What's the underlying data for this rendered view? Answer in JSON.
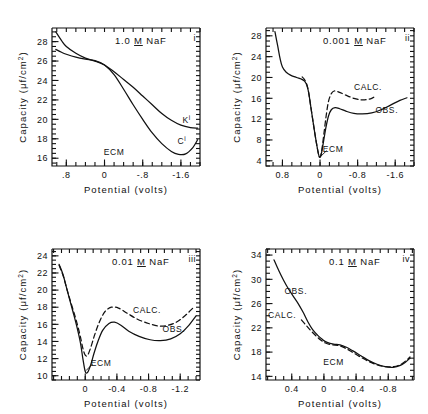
{
  "figure": {
    "axis_x_title": "Potential  (volts)",
    "axis_y_title": "Capacity (μf/cm²)"
  },
  "chart_data": [
    {
      "type": "line",
      "panel": "i",
      "roman": "i",
      "title": "1.0 M NaF",
      "concentration_prefix": "1.0",
      "concentration_molar": "M",
      "concentration_salt": "NaF",
      "xlabel": "Potential  (volts)",
      "ylabel": "Capacity (μf/cm²)",
      "xlim": [
        1.1,
        -2.0
      ],
      "ylim": [
        15.2,
        29.4
      ],
      "xticks": [
        0.8,
        0.0,
        -0.8,
        -1.6
      ],
      "xtick_labels": [
        ".8",
        "0",
        "-.8",
        "-1.6"
      ],
      "yticks": [
        28,
        26,
        24,
        22,
        20,
        18,
        16
      ],
      "ytick_labels": [
        "28",
        "26",
        "24",
        "22",
        "20",
        "18",
        "16"
      ],
      "minor_x_step": 0.2,
      "minor_y_step": 0.5,
      "grid": false,
      "annotations": [
        {
          "text": "ECM",
          "x": -0.2,
          "y": 16.3
        },
        {
          "text": "K",
          "superscript": "i",
          "x": -1.72,
          "y": 19.6
        },
        {
          "text": "C",
          "superscript": "i",
          "x": -1.62,
          "y": 17.5
        }
      ],
      "series": [
        {
          "name": "K-curve",
          "style": "solid",
          "points": [
            [
              1.02,
              29.0
            ],
            [
              0.9,
              28.1
            ],
            [
              0.8,
              27.5
            ],
            [
              0.6,
              26.8
            ],
            [
              0.4,
              26.3
            ],
            [
              0.2,
              26.0
            ],
            [
              0.0,
              25.6
            ],
            [
              -0.2,
              24.9
            ],
            [
              -0.4,
              24.1
            ],
            [
              -0.6,
              23.3
            ],
            [
              -0.8,
              22.4
            ],
            [
              -1.0,
              21.5
            ],
            [
              -1.2,
              20.6
            ],
            [
              -1.4,
              19.9
            ],
            [
              -1.6,
              19.4
            ],
            [
              -1.8,
              19.15
            ],
            [
              -1.95,
              19.1
            ]
          ]
        },
        {
          "name": "C-curve",
          "style": "solid",
          "points": [
            [
              1.02,
              27.2
            ],
            [
              0.9,
              26.9
            ],
            [
              0.8,
              26.7
            ],
            [
              0.6,
              26.4
            ],
            [
              0.4,
              26.2
            ],
            [
              0.2,
              26.05
            ],
            [
              0.0,
              25.6
            ],
            [
              -0.2,
              24.6
            ],
            [
              -0.4,
              23.1
            ],
            [
              -0.6,
              21.5
            ],
            [
              -0.8,
              20.0
            ],
            [
              -1.0,
              18.6
            ],
            [
              -1.2,
              17.5
            ],
            [
              -1.4,
              16.7
            ],
            [
              -1.55,
              16.4
            ],
            [
              -1.7,
              16.45
            ],
            [
              -1.85,
              17.1
            ],
            [
              -1.95,
              17.9
            ]
          ]
        }
      ]
    },
    {
      "type": "line",
      "panel": "ii",
      "roman": "ii",
      "title": "0.001 M NaF",
      "concentration_prefix": "0.001",
      "concentration_molar": "M",
      "concentration_salt": "NaF",
      "xlabel": "Potential  (volts)",
      "ylabel": "Capacity (μf/cm²)",
      "xlim": [
        1.15,
        -2.0
      ],
      "ylim": [
        3.0,
        29.5
      ],
      "xticks": [
        0.8,
        0.0,
        -0.8,
        -1.6
      ],
      "xtick_labels": [
        "0.8",
        "0",
        "-0.8",
        "-1.6"
      ],
      "yticks": [
        28,
        24,
        20,
        16,
        12,
        8,
        4
      ],
      "ytick_labels": [
        "28",
        "24",
        "20",
        "16",
        "12",
        "8",
        "4"
      ],
      "minor_x_step": 0.2,
      "minor_y_step": 1.0,
      "grid": false,
      "annotations": [
        {
          "text": "ECM",
          "x": -0.28,
          "y": 5.6
        },
        {
          "text": "CALC.",
          "x": -1.02,
          "y": 17.6
        },
        {
          "text": "OBS.",
          "x": -1.42,
          "y": 13.2
        }
      ],
      "series": [
        {
          "name": "OBS.",
          "style": "solid",
          "points": [
            [
              0.96,
              28.8
            ],
            [
              0.9,
              26.0
            ],
            [
              0.85,
              23.6
            ],
            [
              0.8,
              22.0
            ],
            [
              0.72,
              21.0
            ],
            [
              0.62,
              20.4
            ],
            [
              0.5,
              20.0
            ],
            [
              0.4,
              19.7
            ],
            [
              0.33,
              19.3
            ],
            [
              0.28,
              18.5
            ],
            [
              0.24,
              17.0
            ],
            [
              0.2,
              14.6
            ],
            [
              0.14,
              11.0
            ],
            [
              0.08,
              7.6
            ],
            [
              0.03,
              5.2
            ],
            [
              0.0,
              4.7
            ],
            [
              -0.03,
              5.4
            ],
            [
              -0.08,
              8.0
            ],
            [
              -0.13,
              10.6
            ],
            [
              -0.18,
              12.6
            ],
            [
              -0.24,
              13.8
            ],
            [
              -0.32,
              14.2
            ],
            [
              -0.42,
              14.0
            ],
            [
              -0.56,
              13.5
            ],
            [
              -0.72,
              13.1
            ],
            [
              -0.9,
              13.0
            ],
            [
              -1.1,
              13.2
            ],
            [
              -1.3,
              13.8
            ],
            [
              -1.5,
              14.7
            ],
            [
              -1.7,
              15.6
            ],
            [
              -1.85,
              16.1
            ]
          ]
        },
        {
          "name": "CALC.",
          "style": "dashed",
          "points": [
            [
              0.38,
              20.1
            ],
            [
              0.33,
              19.6
            ],
            [
              0.28,
              18.6
            ],
            [
              0.24,
              17.0
            ],
            [
              0.2,
              14.6
            ],
            [
              0.14,
              11.0
            ],
            [
              0.08,
              7.6
            ],
            [
              0.03,
              5.2
            ],
            [
              0.0,
              4.7
            ],
            [
              -0.03,
              5.6
            ],
            [
              -0.08,
              9.0
            ],
            [
              -0.13,
              12.6
            ],
            [
              -0.18,
              15.4
            ],
            [
              -0.24,
              16.9
            ],
            [
              -0.3,
              17.4
            ],
            [
              -0.4,
              17.2
            ],
            [
              -0.55,
              16.6
            ],
            [
              -0.72,
              16.0
            ],
            [
              -0.88,
              15.7
            ],
            [
              -1.0,
              15.75
            ],
            [
              -1.1,
              16.0
            ],
            [
              -1.18,
              16.4
            ]
          ]
        }
      ]
    },
    {
      "type": "line",
      "panel": "iii",
      "roman": "iii",
      "title": "0.01 M NaF",
      "concentration_prefix": "0.01",
      "concentration_molar": "M",
      "concentration_salt": "NaF",
      "xlabel": "Potential  (volts)",
      "ylabel": "Capacity (μf/cm²)",
      "xlim": [
        0.42,
        -1.45
      ],
      "ylim": [
        9.5,
        24.8
      ],
      "xticks": [
        0.0,
        -0.4,
        -0.8,
        -1.2
      ],
      "xtick_labels": [
        "0",
        "-0.4",
        "-0.8",
        "-1.2"
      ],
      "yticks": [
        24,
        22,
        20,
        18,
        16,
        14,
        12,
        10
      ],
      "ytick_labels": [
        "24",
        "22",
        "20",
        "18",
        "16",
        "14",
        "12",
        "10"
      ],
      "minor_x_step": 0.1,
      "minor_y_step": 0.5,
      "grid": false,
      "annotations": [
        {
          "text": "ECM",
          "x": -0.2,
          "y": 11.1
        },
        {
          "text": "CALC.",
          "x": -0.78,
          "y": 17.3
        },
        {
          "text": "OBS.",
          "x": -1.12,
          "y": 15.1
        }
      ],
      "series": [
        {
          "name": "OBS.",
          "style": "solid",
          "points": [
            [
              0.33,
              23.0
            ],
            [
              0.28,
              21.8
            ],
            [
              0.24,
              20.4
            ],
            [
              0.2,
              19.0
            ],
            [
              0.15,
              17.3
            ],
            [
              0.1,
              15.5
            ],
            [
              0.06,
              13.8
            ],
            [
              0.03,
              12.0
            ],
            [
              0.0,
              10.5
            ],
            [
              -0.03,
              10.4
            ],
            [
              -0.07,
              11.3
            ],
            [
              -0.11,
              12.6
            ],
            [
              -0.16,
              14.0
            ],
            [
              -0.22,
              15.3
            ],
            [
              -0.3,
              16.1
            ],
            [
              -0.37,
              16.25
            ],
            [
              -0.45,
              15.9
            ],
            [
              -0.55,
              15.2
            ],
            [
              -0.68,
              14.6
            ],
            [
              -0.82,
              14.2
            ],
            [
              -0.95,
              14.1
            ],
            [
              -1.08,
              14.3
            ],
            [
              -1.2,
              14.9
            ],
            [
              -1.3,
              15.8
            ],
            [
              -1.4,
              17.0
            ]
          ]
        },
        {
          "name": "CALC.",
          "style": "dashed",
          "points": [
            [
              0.33,
              22.9
            ],
            [
              0.28,
              21.7
            ],
            [
              0.24,
              20.4
            ],
            [
              0.2,
              19.1
            ],
            [
              0.15,
              17.6
            ],
            [
              0.1,
              16.0
            ],
            [
              0.06,
              14.5
            ],
            [
              0.03,
              13.2
            ],
            [
              0.0,
              12.4
            ],
            [
              -0.03,
              12.4
            ],
            [
              -0.07,
              13.3
            ],
            [
              -0.12,
              14.8
            ],
            [
              -0.18,
              16.3
            ],
            [
              -0.25,
              17.5
            ],
            [
              -0.33,
              18.0
            ],
            [
              -0.42,
              17.9
            ],
            [
              -0.53,
              17.3
            ],
            [
              -0.66,
              16.6
            ],
            [
              -0.8,
              16.1
            ],
            [
              -0.93,
              15.8
            ],
            [
              -1.05,
              15.9
            ],
            [
              -1.16,
              16.3
            ],
            [
              -1.26,
              17.0
            ],
            [
              -1.36,
              17.9
            ]
          ]
        }
      ]
    },
    {
      "type": "line",
      "panel": "iv",
      "roman": "iv",
      "title": "0.1 M NaF",
      "concentration_prefix": "0.1",
      "concentration_molar": "M",
      "concentration_salt": "NaF",
      "xlabel": "Potential  (volts)",
      "ylabel": "Capacity (μf/cm²)",
      "xlim": [
        0.72,
        -1.12
      ],
      "ylim": [
        13.4,
        35.0
      ],
      "xticks": [
        0.4,
        0.0,
        -0.4,
        -0.8
      ],
      "xtick_labels": [
        "0.4",
        "0",
        "-0.4",
        "-0.8"
      ],
      "yticks": [
        34,
        30,
        26,
        22,
        18,
        14
      ],
      "ytick_labels": [
        "34",
        "30",
        "26",
        "22",
        "18",
        "14"
      ],
      "minor_x_step": 0.1,
      "minor_y_step": 1.0,
      "grid": false,
      "annotations": [
        {
          "text": "OBS.",
          "x": 0.35,
          "y": 27.6
        },
        {
          "text": "CALC.",
          "x": 0.52,
          "y": 23.6
        },
        {
          "text": "ECM",
          "x": -0.12,
          "y": 15.9
        }
      ],
      "series": [
        {
          "name": "OBS.",
          "style": "solid",
          "points": [
            [
              0.62,
              33.2
            ],
            [
              0.56,
              31.4
            ],
            [
              0.5,
              29.8
            ],
            [
              0.44,
              28.4
            ],
            [
              0.38,
              27.2
            ],
            [
              0.32,
              26.0
            ],
            [
              0.26,
              24.6
            ],
            [
              0.2,
              23.0
            ],
            [
              0.14,
              21.7
            ],
            [
              0.08,
              20.8
            ],
            [
              0.02,
              20.1
            ],
            [
              -0.04,
              19.6
            ],
            [
              -0.12,
              19.3
            ],
            [
              -0.2,
              19.2
            ],
            [
              -0.28,
              18.8
            ],
            [
              -0.36,
              18.2
            ],
            [
              -0.46,
              17.4
            ],
            [
              -0.56,
              16.6
            ],
            [
              -0.66,
              16.0
            ],
            [
              -0.76,
              15.6
            ],
            [
              -0.86,
              15.5
            ],
            [
              -0.95,
              15.8
            ],
            [
              -1.02,
              16.4
            ],
            [
              -1.07,
              17.0
            ]
          ]
        },
        {
          "name": "CALC.",
          "style": "dashed",
          "points": [
            [
              0.28,
              23.3
            ],
            [
              0.22,
              22.4
            ],
            [
              0.16,
              21.5
            ],
            [
              0.1,
              20.7
            ],
            [
              0.04,
              20.0
            ],
            [
              -0.02,
              19.5
            ],
            [
              -0.1,
              19.2
            ],
            [
              -0.18,
              19.1
            ],
            [
              -0.26,
              18.7
            ],
            [
              -0.34,
              18.1
            ],
            [
              -0.44,
              17.3
            ],
            [
              -0.55,
              16.5
            ],
            [
              -0.66,
              15.9
            ],
            [
              -0.77,
              15.6
            ],
            [
              -0.87,
              15.6
            ],
            [
              -0.96,
              16.0
            ],
            [
              -1.03,
              16.7
            ],
            [
              -1.07,
              17.2
            ]
          ]
        }
      ]
    }
  ]
}
